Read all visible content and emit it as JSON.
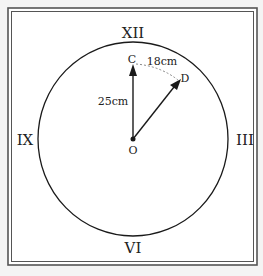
{
  "diagram": {
    "numerals": {
      "top": "XII",
      "right": "III",
      "bottom": "VI",
      "left": "IX"
    },
    "points": {
      "center": "O",
      "minute_tip": "C",
      "moved_tip": "D"
    },
    "labels": {
      "radius": "25cm",
      "arc": "18cm"
    },
    "colors": {
      "frame": "#444444",
      "stroke": "#1a1a1a",
      "dashed": "#888888",
      "background": "#ffffff"
    }
  }
}
